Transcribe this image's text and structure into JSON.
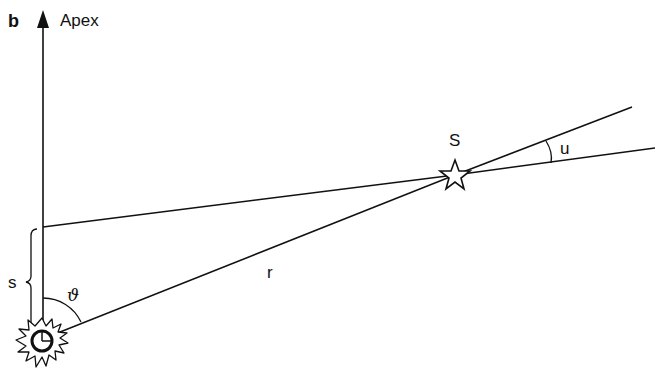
{
  "figure": {
    "panel_label": "b",
    "apex_label": "Apex",
    "star_label": "S",
    "distance_label": "r",
    "displacement_label": "s",
    "angle_theta_label": "ϑ",
    "angle_u_label": "u"
  },
  "colors": {
    "line": "#111111",
    "background": "#ffffff"
  }
}
